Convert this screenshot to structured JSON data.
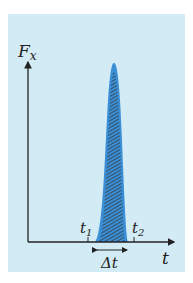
{
  "diagram": {
    "y_label": "F",
    "y_label_sub": "x",
    "x_label": "t",
    "t1_label": "t",
    "t1_sub": "1",
    "t2_label": "t",
    "t2_sub": "2",
    "delta_label": "Δt",
    "colors": {
      "background": "#d3ebf5",
      "pulse": "#3a8fd6",
      "hatch": "#333333",
      "axis": "#222222"
    }
  }
}
